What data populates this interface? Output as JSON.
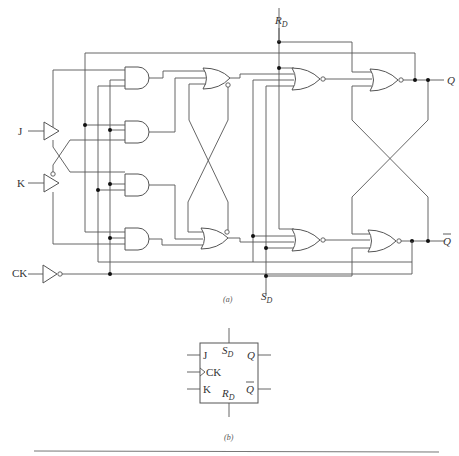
{
  "figure": {
    "part_a": {
      "caption": "(a)",
      "inputs": {
        "j": "J",
        "k": "K",
        "ck": "CK"
      },
      "outputs": {
        "q": "Q",
        "q_bar": "Q"
      },
      "preset": {
        "main": "R",
        "sub": "D"
      },
      "clear": {
        "main": "S",
        "sub": "D"
      },
      "gates": {
        "input_buffers": [
          "J buffer",
          "K buffer",
          "CK inverter"
        ],
        "and_gates": 4,
        "master_nor_latch": 2,
        "slave_nor_gates": 2,
        "output_nor_latch": 2
      }
    },
    "part_b": {
      "caption": "(b)",
      "symbol": {
        "j": "J",
        "ck": "CK",
        "k": "K",
        "sd": {
          "main": "S",
          "sub": "D"
        },
        "rd": {
          "main": "R",
          "sub": "D"
        },
        "q": "Q",
        "q_bar": "Q"
      }
    }
  }
}
